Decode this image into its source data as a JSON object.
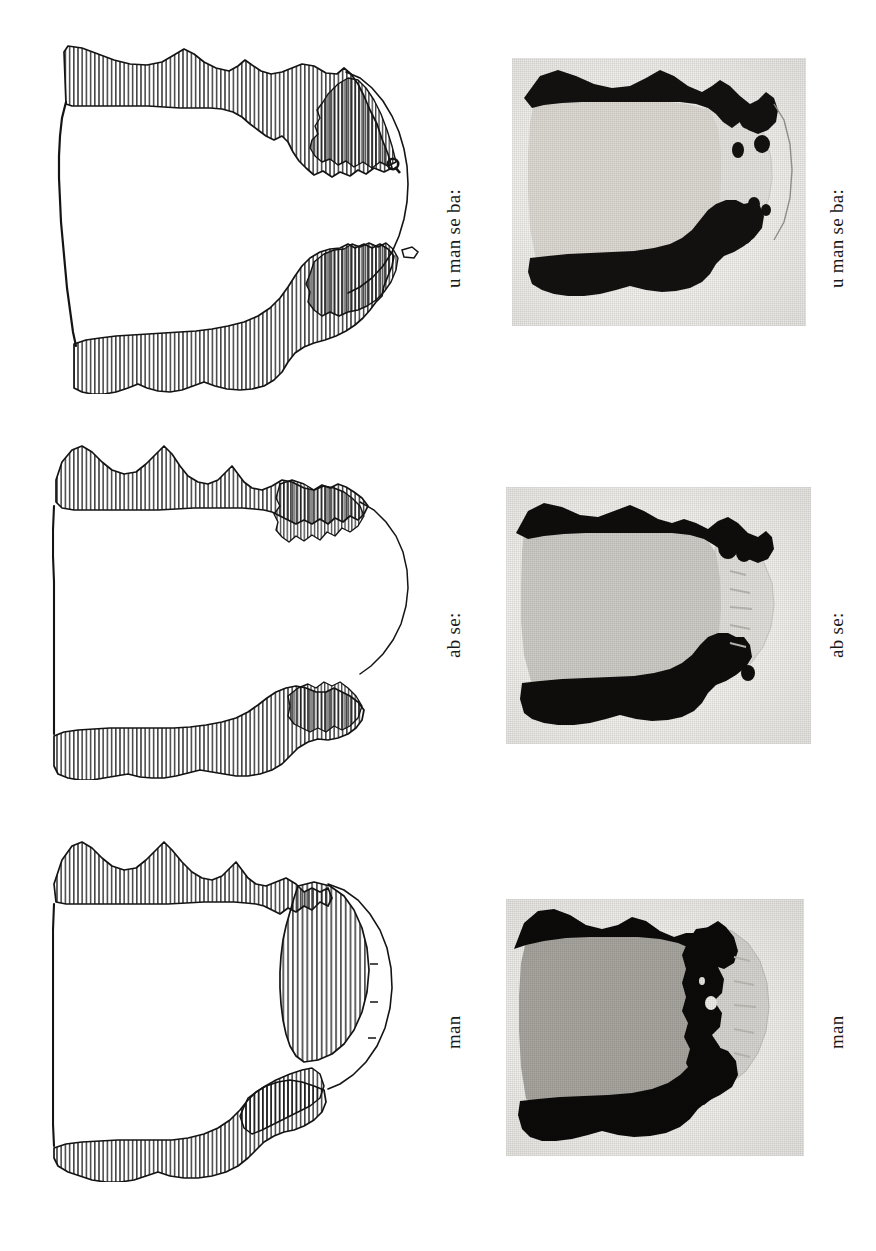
{
  "plate": {
    "width": 876,
    "height": 1251,
    "background_color": "#ffffff",
    "ink_color": "#111111",
    "description": "Comparative plate: three line drawings (left column) paired with three halftone photographs (right column) of sectioned specimens, each pair labelled with a rotated caption.",
    "columns": [
      {
        "name": "line-drawings",
        "kind": "drawing"
      },
      {
        "name": "photographs",
        "kind": "halftone-photograph"
      }
    ]
  },
  "figures": [
    {
      "id": "row-1",
      "label": "u man se ba:",
      "drawing": {
        "name": "drawing-u-man-se-ba",
        "hatching": "vertical-line",
        "outline_color": "#111111"
      },
      "photograph": {
        "name": "photograph-u-man-se-ba",
        "paper_tone": "#f2f1ee",
        "mid_tone": "#dedbd5",
        "dark_tone": "#141210"
      }
    },
    {
      "id": "row-2",
      "label": "ab se:",
      "drawing": {
        "name": "drawing-ab-se",
        "hatching": "vertical-line",
        "outline_color": "#111111"
      },
      "photograph": {
        "name": "photograph-ab-se",
        "paper_tone": "#f2f1ee",
        "mid_tone": "#cfcdc7",
        "dark_tone": "#100e0d"
      }
    },
    {
      "id": "row-3",
      "label": "man",
      "drawing": {
        "name": "drawing-man",
        "hatching": "vertical-line",
        "outline_color": "#111111"
      },
      "photograph": {
        "name": "photograph-man",
        "paper_tone": "#f0efec",
        "mid_tone": "#a9a6a0",
        "dark_tone": "#0c0b0a"
      }
    }
  ],
  "captions": {
    "row1_drawing": "u man se ba:",
    "row1_photo": "u man se ba:",
    "row2_drawing": "ab se:",
    "row2_photo": "ab se:",
    "row3_drawing": "man",
    "row3_photo": "man"
  },
  "marks": {
    "row1_detail_glyph": "Q"
  }
}
